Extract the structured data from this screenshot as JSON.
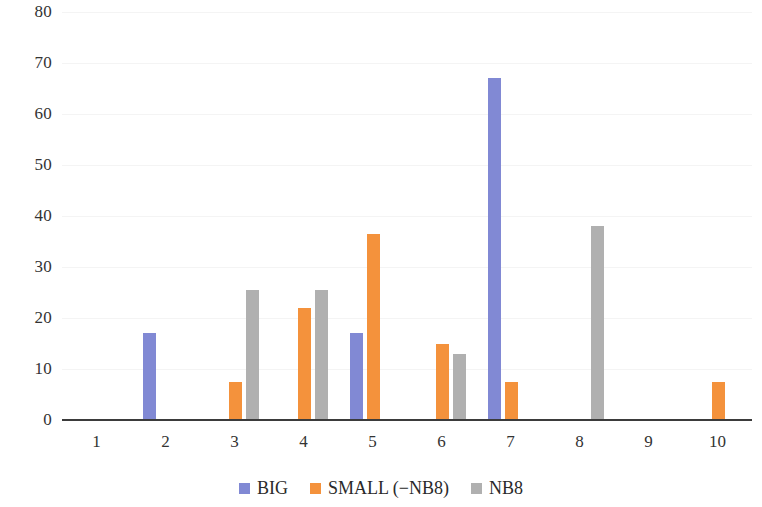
{
  "chart_data": {
    "type": "bar",
    "title": "",
    "subtitle": "",
    "xlabel": "",
    "ylabel": "",
    "categories": [
      "1",
      "2",
      "3",
      "4",
      "5",
      "6",
      "7",
      "8",
      "9",
      "10"
    ],
    "series": [
      {
        "name": "BIG",
        "color": "#8189d4",
        "values": [
          0,
          17,
          0,
          0,
          17,
          0,
          67,
          0,
          0,
          0
        ]
      },
      {
        "name": "SMALL (−NB8)",
        "color": "#f4923c",
        "values": [
          0,
          0,
          7.5,
          22,
          36.5,
          15,
          7.5,
          0,
          0,
          7.5
        ]
      },
      {
        "name": "NB8",
        "color": "#b0b0b0",
        "values": [
          0,
          0,
          25.5,
          25.5,
          0,
          13,
          0,
          38,
          0,
          0
        ]
      }
    ],
    "ylim": [
      0,
      80
    ],
    "y_ticks": [
      "0",
      "10",
      "20",
      "30",
      "40",
      "50",
      "60",
      "70",
      "80"
    ],
    "y_tick_values": [
      0,
      10,
      20,
      30,
      40,
      50,
      60,
      70,
      80
    ],
    "grid": true,
    "grid_axis": "y",
    "legend_position": "bottom"
  },
  "legend": {
    "items": [
      {
        "label": "BIG",
        "color": "#8189d4"
      },
      {
        "label": "SMALL (−NB8)",
        "color": "#f4923c"
      },
      {
        "label": "NB8",
        "color": "#b0b0b0"
      }
    ]
  }
}
